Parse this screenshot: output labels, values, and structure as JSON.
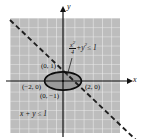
{
  "figure": {
    "type": "coordinate-plane-inequality-region",
    "axes": {
      "x_label": "x",
      "y_label": "y"
    },
    "origin": {
      "px": 63,
      "py": 81
    },
    "grid": {
      "left": 10,
      "top": 18,
      "right": 120,
      "bottom": 133,
      "cell": 9.2,
      "shown": true
    },
    "colors": {
      "shade_fill": "#bdbdbd",
      "grid_line": "#e8e8e8",
      "curve": "#111111",
      "dash": "#1a1a1a",
      "axis": "#111111",
      "lens_fill": "#8c8c8c",
      "background": "#ffffff"
    },
    "labels": {
      "point_top": "(0, 1)",
      "point_left": "(−2, 0)",
      "point_right": "(2, 0)",
      "point_bottom": "(0, −1)",
      "ellipse_num": "x",
      "ellipse_num_sup": "2",
      "ellipse_den": "4",
      "ellipse_rest_plus": "+",
      "ellipse_rest_y": "y",
      "ellipse_rest_y_sup": "2",
      "ellipse_rest_tail": "≤ 1",
      "line_inequality": "x + y ≤ 1"
    },
    "ellipse": {
      "cx": 63,
      "cy": 81,
      "rx": 18.4,
      "ry": 9.2,
      "a": 2,
      "b": 1
    },
    "dashed_line": {
      "equation": "x + y = 1",
      "from": [
        12,
        22
      ],
      "to": [
        133,
        137
      ]
    }
  }
}
